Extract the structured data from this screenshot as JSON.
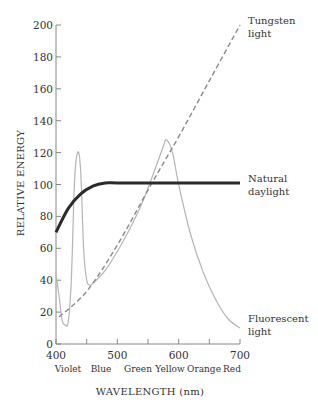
{
  "chart_data": {
    "type": "line",
    "title": "",
    "xlabel": "WAVELENGTH (nm)",
    "ylabel": "RELATIVE ENERGY",
    "xlim": [
      400,
      700
    ],
    "ylim": [
      0,
      200
    ],
    "x_ticks": [
      400,
      500,
      600,
      700
    ],
    "x_minor_ticks": [
      450,
      550,
      650
    ],
    "y_ticks": [
      0,
      20,
      40,
      60,
      80,
      100,
      120,
      140,
      160,
      180,
      200
    ],
    "color_bands": [
      "Violet",
      "Blue",
      "Green",
      "Yellow",
      "Orange",
      "Red"
    ],
    "grid": false,
    "legend": "inline labels at right end of each curve",
    "series": [
      {
        "name": "Tungsten light",
        "style": "dashed",
        "color": "#8a8a8a",
        "x": [
          405,
          450,
          500,
          555,
          600,
          650,
          700
        ],
        "y": [
          17,
          33,
          62,
          100,
          130,
          165,
          200
        ]
      },
      {
        "name": "Natural daylight",
        "style": "solid-bold",
        "color": "#2b2b2b",
        "x": [
          400,
          420,
          440,
          460,
          480,
          500,
          550,
          600,
          650,
          700
        ],
        "y": [
          70,
          85,
          94,
          99,
          101,
          101,
          101,
          101,
          101,
          101
        ]
      },
      {
        "name": "Fluorescent light",
        "style": "solid-thin",
        "color": "#b5b5b5",
        "x": [
          400,
          405,
          410,
          415,
          420,
          425,
          430,
          435,
          440,
          445,
          450,
          455,
          460,
          480,
          500,
          520,
          540,
          560,
          575,
          580,
          590,
          600,
          620,
          640,
          660,
          680,
          700
        ],
        "y": [
          44,
          30,
          15,
          12,
          14,
          40,
          100,
          120,
          110,
          60,
          40,
          37,
          38,
          46,
          58,
          72,
          88,
          108,
          124,
          128,
          120,
          100,
          68,
          45,
          28,
          16,
          10
        ]
      }
    ]
  },
  "labels": {
    "y_axis_title": "RELATIVE ENERGY",
    "x_axis_title": "WAVELENGTH (nm)",
    "x_ticks": [
      "400",
      "500",
      "600",
      "700"
    ],
    "y_ticks": [
      "0",
      "20",
      "40",
      "60",
      "80",
      "100",
      "120",
      "140",
      "160",
      "180",
      "200"
    ],
    "color_bands": [
      "Violet",
      "Blue",
      "Green",
      "Yellow",
      "Orange",
      "Red"
    ],
    "tungsten": [
      "Tungsten",
      "light"
    ],
    "daylight": [
      "Natural",
      "daylight"
    ],
    "fluorescent": [
      "Fluorescent",
      "light"
    ]
  }
}
